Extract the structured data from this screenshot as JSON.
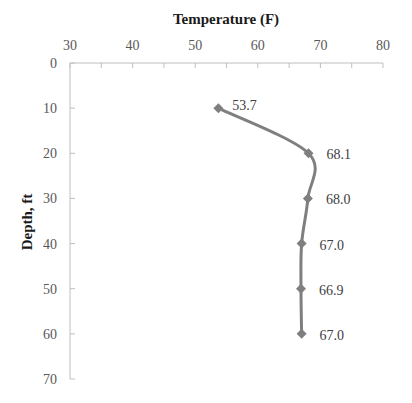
{
  "chart_data": {
    "type": "line",
    "title": "",
    "xlabel": "Temperature (F)",
    "ylabel": "Depth, ft",
    "x_axis_position": "top",
    "y_axis_inverted": true,
    "xlim": [
      30,
      80
    ],
    "ylim": [
      0,
      70
    ],
    "x_ticks": [
      30,
      40,
      50,
      60,
      70,
      80
    ],
    "y_ticks": [
      0,
      10,
      20,
      30,
      40,
      50,
      60,
      70
    ],
    "grid": false,
    "legend": null,
    "series": [
      {
        "name": "Temperature profile",
        "color": "#7f7f7f",
        "marker": "diamond",
        "smooth": true,
        "points": [
          {
            "depth": 10,
            "temperature": 53.7,
            "label": "53.7"
          },
          {
            "depth": 20,
            "temperature": 68.1,
            "label": "68.1"
          },
          {
            "depth": 30,
            "temperature": 68.0,
            "label": "68.0"
          },
          {
            "depth": 40,
            "temperature": 67.0,
            "label": "67.0"
          },
          {
            "depth": 50,
            "temperature": 66.9,
            "label": "66.9"
          },
          {
            "depth": 60,
            "temperature": 67.0,
            "label": "67.0"
          }
        ]
      }
    ]
  }
}
